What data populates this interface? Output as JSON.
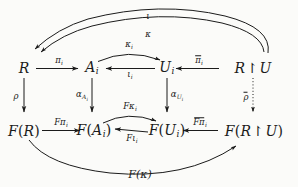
{
  "figure": {
    "kind": "commutative-diagram",
    "background_color": "#fbfbf9",
    "ink_color": "#1b1b1b"
  },
  "nodes": {
    "top_left": {
      "id": "R",
      "base": "R",
      "sub": "",
      "label": "R"
    },
    "top_mid_left": {
      "id": "A_i",
      "base": "A",
      "sub": "i",
      "label": "A_i"
    },
    "top_mid_right": {
      "id": "U_i",
      "base": "U",
      "sub": "i",
      "label": "U_i"
    },
    "top_right": {
      "id": "R_restr_U",
      "base": "R",
      "restr": "↾",
      "tail": "U",
      "label": "R ↾ U"
    },
    "bottom_left": {
      "id": "F(R)",
      "fn": "F",
      "open": "(",
      "base": "R",
      "sub": "",
      "close": ")",
      "label": "F(R)"
    },
    "bottom_mid_left": {
      "id": "F(A_i)",
      "fn": "F",
      "open": "(",
      "base": "A",
      "sub": "i",
      "close": ")",
      "label": "F(A_i)"
    },
    "bottom_mid_right": {
      "id": "F(U_i)",
      "fn": "F",
      "open": "(",
      "base": "U",
      "sub": "i",
      "close": ")",
      "label": "F(U_i)"
    },
    "bottom_right": {
      "id": "F(R_restr_U)",
      "fn": "F",
      "open": "(",
      "base": "R",
      "restr": "↾",
      "tail": "U",
      "close": ")",
      "label": "F(R ↾ U)"
    }
  },
  "edges": {
    "pi_i": {
      "from": "R",
      "to": "A_i",
      "sym": "π",
      "sub": "i",
      "bar": false,
      "style": "solid",
      "shape": "straight"
    },
    "iota_i": {
      "from": "U_i",
      "to": "A_i",
      "sym": "ι",
      "sub": "i",
      "bar": false,
      "style": "solid",
      "shape": "straight"
    },
    "kappa_i": {
      "from": "A_i",
      "to": "U_i",
      "sym": "κ",
      "sub": "i",
      "bar": false,
      "style": "solid",
      "shape": "arc-up"
    },
    "pibar_i": {
      "from": "R_restr_U",
      "to": "U_i",
      "sym": "π",
      "sub": "i",
      "bar": true,
      "style": "solid",
      "shape": "straight"
    },
    "kappa": {
      "from": "R_restr_U",
      "to": "R",
      "sym": "κ",
      "sub": "",
      "bar": false,
      "style": "solid",
      "shape": "arc-up-long"
    },
    "iota": {
      "from": "R_restr_U",
      "to": "R",
      "sym": "ι",
      "sub": "",
      "bar": false,
      "style": "solid",
      "shape": "arc-up-longer"
    },
    "rho": {
      "from": "R",
      "to": "F(R)",
      "sym": "ρ",
      "sub": "",
      "bar": false,
      "style": "solid",
      "shape": "vertical"
    },
    "alpha_A_i": {
      "from": "A_i",
      "to": "F(A_i)",
      "sym": "α",
      "sub": "A",
      "subsub": "i",
      "bar": false,
      "style": "solid",
      "shape": "vertical"
    },
    "alpha_U_i": {
      "from": "U_i",
      "to": "F(U_i)",
      "sym": "α",
      "sub": "U",
      "subsub": "i",
      "bar": false,
      "style": "solid",
      "shape": "vertical"
    },
    "rhobar": {
      "from": "R_restr_U",
      "to": "F(R_restr_U)",
      "sym": "ρ",
      "sub": "",
      "bar": true,
      "style": "dotted",
      "shape": "vertical"
    },
    "F_pi_i": {
      "from": "F(R)",
      "to": "F(A_i)",
      "sym": "Fπ",
      "sub": "i",
      "bar": false,
      "style": "solid",
      "shape": "straight"
    },
    "F_iota_i": {
      "from": "F(U_i)",
      "to": "F(A_i)",
      "sym": "Fι",
      "sub": "i",
      "bar": false,
      "style": "solid",
      "shape": "straight"
    },
    "F_kappa_i": {
      "from": "F(A_i)",
      "to": "F(U_i)",
      "sym": "Fκ",
      "sub": "i",
      "bar": false,
      "style": "solid",
      "shape": "arc-up"
    },
    "F_pibar_i": {
      "from": "F(R_restr_U)",
      "to": "F(U_i)",
      "sym": "Fπ",
      "sub": "i",
      "bar": true,
      "style": "solid",
      "shape": "straight"
    },
    "F_kappa": {
      "from": "F(R)",
      "to": "F(R_restr_U)",
      "sym": "F(κ)",
      "sub": "",
      "bar": false,
      "style": "solid",
      "shape": "arc-down-long"
    }
  },
  "labels": {
    "pi_i": {
      "sym": "π",
      "sub": "i"
    },
    "iota_i": {
      "sym": "ι",
      "sub": "i"
    },
    "kappa_i": {
      "sym": "κ",
      "sub": "i"
    },
    "pibar_i": {
      "sym": "π",
      "sub": "i"
    },
    "kappa": {
      "sym": "κ",
      "sub": ""
    },
    "iota": {
      "sym": "ι",
      "sub": ""
    },
    "rho": {
      "sym": "ρ",
      "sub": ""
    },
    "rhobar": {
      "sym": "ρ",
      "sub": ""
    },
    "alpha_A_i": {
      "sym": "α",
      "sub": "A",
      "subsub": "i"
    },
    "alpha_U_i": {
      "sym": "α",
      "sub": "U",
      "subsub": "i"
    },
    "F_pi_i": {
      "sym": "Fπ",
      "sub": "i"
    },
    "F_iota_i": {
      "sym": "Fι",
      "sub": "i"
    },
    "F_kappa_i": {
      "sym": "Fκ",
      "sub": "i"
    },
    "F_pibar_i": {
      "sym": "Fπ",
      "sub": "i"
    },
    "F_kappa": {
      "sym": "F(κ)",
      "sub": ""
    }
  }
}
